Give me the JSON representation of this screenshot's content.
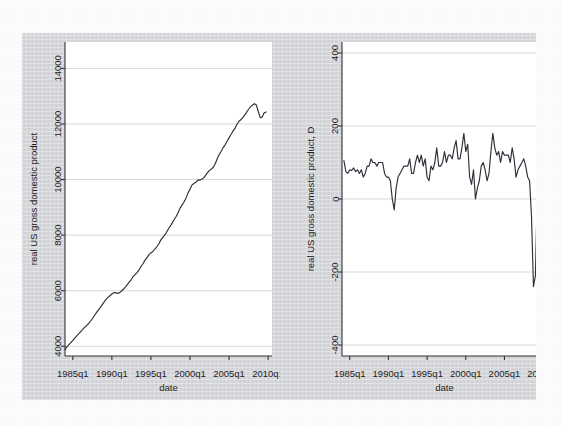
{
  "figure": {
    "background_color": "#d9dade",
    "plot_background_color": "#ffffff",
    "line_color": "#2e2e38",
    "grid_color": "#d2d2d2",
    "axis_color": "#333333"
  },
  "chart_data": [
    {
      "type": "line",
      "panel": "left",
      "title": "",
      "xlabel": "date",
      "ylabel": "real US gross domestic product",
      "xtick_labels": [
        "1985q1",
        "1990q1",
        "1995q1",
        "2000q1",
        "2005q1",
        "2010q1"
      ],
      "xtick_values": [
        1985,
        1990,
        1995,
        2000,
        2005,
        2010
      ],
      "ytick_labels": [
        "4000",
        "6000",
        "8000",
        "10000",
        "12000",
        "14000"
      ],
      "ytick_values": [
        4000,
        6000,
        8000,
        10000,
        12000,
        14000
      ],
      "xlim": [
        1984.0,
        2010.5
      ],
      "ylim": [
        3650,
        14950
      ],
      "grid": true,
      "legend": "none",
      "x": [
        1984.0,
        1984.25,
        1984.5,
        1984.75,
        1985.0,
        1985.25,
        1985.5,
        1985.75,
        1986.0,
        1986.25,
        1986.5,
        1986.75,
        1987.0,
        1987.25,
        1987.5,
        1987.75,
        1988.0,
        1988.25,
        1988.5,
        1988.75,
        1989.0,
        1989.25,
        1989.5,
        1989.75,
        1990.0,
        1990.25,
        1990.5,
        1990.75,
        1991.0,
        1991.25,
        1991.5,
        1991.75,
        1992.0,
        1992.25,
        1992.5,
        1992.75,
        1993.0,
        1993.25,
        1993.5,
        1993.75,
        1994.0,
        1994.25,
        1994.5,
        1994.75,
        1995.0,
        1995.25,
        1995.5,
        1995.75,
        1996.0,
        1996.25,
        1996.5,
        1996.75,
        1997.0,
        1997.25,
        1997.5,
        1997.75,
        1998.0,
        1998.25,
        1998.5,
        1998.75,
        1999.0,
        1999.25,
        1999.5,
        1999.75,
        2000.0,
        2000.25,
        2000.5,
        2000.75,
        2001.0,
        2001.25,
        2001.5,
        2001.75,
        2002.0,
        2002.25,
        2002.5,
        2002.75,
        2003.0,
        2003.25,
        2003.5,
        2003.75,
        2004.0,
        2004.25,
        2004.5,
        2004.75,
        2005.0,
        2005.25,
        2005.5,
        2005.75,
        2006.0,
        2006.25,
        2006.5,
        2006.75,
        2007.0,
        2007.25,
        2007.5,
        2007.75,
        2008.0,
        2008.25,
        2008.5,
        2008.75,
        2009.0,
        2009.25,
        2009.5,
        2009.75
      ],
      "values": [
        3880,
        3985,
        4060,
        4130,
        4210,
        4290,
        4375,
        4450,
        4530,
        4600,
        4680,
        4740,
        4810,
        4900,
        4990,
        5100,
        5200,
        5300,
        5390,
        5490,
        5590,
        5690,
        5760,
        5820,
        5880,
        5930,
        5930,
        5900,
        5930,
        5990,
        6060,
        6140,
        6230,
        6320,
        6410,
        6520,
        6590,
        6660,
        6760,
        6880,
        6980,
        7100,
        7190,
        7300,
        7360,
        7410,
        7500,
        7580,
        7680,
        7820,
        7910,
        8000,
        8100,
        8230,
        8330,
        8450,
        8570,
        8680,
        8820,
        8980,
        9090,
        9200,
        9340,
        9520,
        9650,
        9800,
        9860,
        9900,
        9980,
        9980,
        10010,
        10060,
        10150,
        10250,
        10330,
        10380,
        10450,
        10580,
        10760,
        10900,
        11020,
        11150,
        11250,
        11380,
        11500,
        11620,
        11740,
        11840,
        11980,
        12090,
        12150,
        12230,
        12320,
        12420,
        12530,
        12620,
        12680,
        12730,
        12680,
        12440,
        12230,
        12250,
        12400,
        12430
      ]
    },
    {
      "type": "line",
      "panel": "right",
      "title": "",
      "xlabel": "date",
      "ylabel": "real US gross domestic product, D",
      "xtick_labels": [
        "1985q1",
        "1990q1",
        "1995q1",
        "2000q1",
        "2005q1",
        "2010q1"
      ],
      "xtick_values": [
        1985,
        1990,
        1995,
        2000,
        2005,
        2010
      ],
      "ytick_labels": [
        "-400",
        "-200",
        "0",
        "200",
        "400"
      ],
      "ytick_values": [
        -400,
        -200,
        0,
        200,
        400
      ],
      "xlim": [
        1984.0,
        2010.5
      ],
      "ylim": [
        -430,
        430
      ],
      "grid": true,
      "legend": "none",
      "x": [
        1984.25,
        1984.5,
        1984.75,
        1985.0,
        1985.25,
        1985.5,
        1985.75,
        1986.0,
        1986.25,
        1986.5,
        1986.75,
        1987.0,
        1987.25,
        1987.5,
        1987.75,
        1988.0,
        1988.25,
        1988.5,
        1988.75,
        1989.0,
        1989.25,
        1989.5,
        1989.75,
        1990.0,
        1990.25,
        1990.5,
        1990.75,
        1991.0,
        1991.25,
        1991.5,
        1991.75,
        1992.0,
        1992.25,
        1992.5,
        1992.75,
        1993.0,
        1993.25,
        1993.5,
        1993.75,
        1994.0,
        1994.25,
        1994.5,
        1994.75,
        1995.0,
        1995.25,
        1995.5,
        1995.75,
        1996.0,
        1996.25,
        1996.5,
        1996.75,
        1997.0,
        1997.25,
        1997.5,
        1997.75,
        1998.0,
        1998.25,
        1998.5,
        1998.75,
        1999.0,
        1999.25,
        1999.5,
        1999.75,
        2000.0,
        2000.25,
        2000.5,
        2000.75,
        2001.0,
        2001.25,
        2001.5,
        2001.75,
        2002.0,
        2002.25,
        2002.5,
        2002.75,
        2003.0,
        2003.25,
        2003.5,
        2003.75,
        2004.0,
        2004.25,
        2004.5,
        2004.75,
        2005.0,
        2005.25,
        2005.5,
        2005.75,
        2006.0,
        2006.25,
        2006.5,
        2006.75,
        2007.0,
        2007.25,
        2007.5,
        2007.75,
        2008.0,
        2008.25,
        2008.5,
        2008.75,
        2009.0,
        2009.25,
        2009.5,
        2009.75
      ],
      "values": [
        105,
        75,
        70,
        80,
        78,
        85,
        75,
        80,
        70,
        80,
        60,
        70,
        90,
        90,
        110,
        100,
        100,
        90,
        100,
        100,
        100,
        70,
        60,
        60,
        50,
        0,
        -30,
        30,
        60,
        70,
        80,
        90,
        90,
        90,
        110,
        70,
        70,
        100,
        120,
        100,
        120,
        90,
        110,
        60,
        50,
        90,
        80,
        100,
        140,
        90,
        90,
        100,
        130,
        100,
        120,
        120,
        110,
        140,
        160,
        110,
        110,
        140,
        180,
        130,
        150,
        60,
        40,
        80,
        0,
        30,
        50,
        90,
        100,
        80,
        50,
        70,
        130,
        180,
        140,
        120,
        130,
        100,
        130,
        120,
        120,
        120,
        100,
        140,
        110,
        60,
        80,
        90,
        100,
        110,
        90,
        60,
        50,
        -50,
        -240,
        -210,
        20,
        150,
        30
      ]
    }
  ]
}
